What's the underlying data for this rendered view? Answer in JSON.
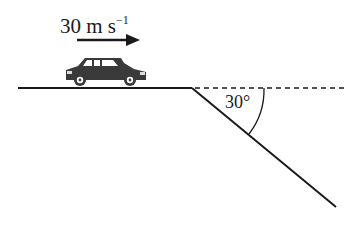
{
  "diagram": {
    "velocity_label": "30 m s",
    "velocity_exponent": "−1",
    "angle_label": "30°",
    "colors": {
      "ink": "#1a1a1a",
      "car": "#3a3a3a",
      "background": "#ffffff"
    }
  }
}
